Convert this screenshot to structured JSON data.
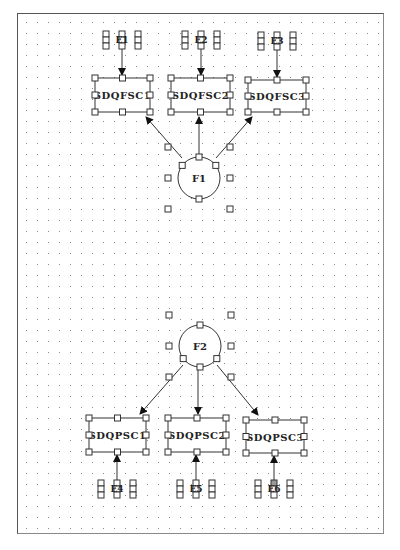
{
  "diagram": {
    "background": "#ffffff",
    "grid_spacing": 11,
    "factors": [
      {
        "id": "F1",
        "label": "F1",
        "cx": 199,
        "cy": 178,
        "r": 21
      },
      {
        "id": "F2",
        "label": "F2",
        "cx": 200,
        "cy": 346,
        "r": 21
      }
    ],
    "indicators": [
      {
        "id": "top1",
        "label": "SDQFSC1",
        "x": 95,
        "y": 78,
        "w": 55,
        "h": 34,
        "factor": "F1"
      },
      {
        "id": "top2",
        "label": "SDQFSC2",
        "x": 171,
        "y": 78,
        "w": 59,
        "h": 34,
        "factor": "F1"
      },
      {
        "id": "top3",
        "label": "SDQFSC3",
        "x": 248,
        "y": 80,
        "w": 58,
        "h": 32,
        "factor": "F1"
      },
      {
        "id": "bot1",
        "label": "SDQPSC1",
        "x": 89,
        "y": 418,
        "w": 57,
        "h": 34,
        "factor": "F2"
      },
      {
        "id": "bot2",
        "label": "SDQPSC2",
        "x": 168,
        "y": 418,
        "w": 58,
        "h": 34,
        "factor": "F2"
      },
      {
        "id": "bot3",
        "label": "SDQPSC3",
        "x": 246,
        "y": 420,
        "w": 58,
        "h": 33,
        "factor": "F2"
      }
    ],
    "errors": [
      {
        "id": "E1",
        "label": "E1",
        "cx": 122,
        "cy": 40,
        "target": "top1"
      },
      {
        "id": "E2",
        "label": "E2",
        "cx": 201,
        "cy": 40,
        "target": "top2"
      },
      {
        "id": "E3",
        "label": "E3",
        "cx": 277,
        "cy": 41,
        "target": "top3"
      },
      {
        "id": "E4",
        "label": "E4",
        "cx": 117,
        "cy": 489,
        "target": "bot1"
      },
      {
        "id": "E5",
        "label": "E5",
        "cx": 196,
        "cy": 489,
        "target": "bot2"
      },
      {
        "id": "E6",
        "label": "E6",
        "cx": 274,
        "cy": 489,
        "target": "bot3",
        "selected": true
      }
    ],
    "paths": [
      {
        "from": "F1",
        "to": "top1",
        "x1": 182,
        "y1": 158,
        "x2": 146,
        "y2": 117
      },
      {
        "from": "F1",
        "to": "top2",
        "x1": 199,
        "y1": 157,
        "x2": 199,
        "y2": 117
      },
      {
        "from": "F1",
        "to": "top3",
        "x1": 216,
        "y1": 158,
        "x2": 252,
        "y2": 117
      },
      {
        "from": "F2",
        "to": "bot1",
        "x1": 183,
        "y1": 365,
        "x2": 140,
        "y2": 414
      },
      {
        "from": "F2",
        "to": "bot2",
        "x1": 198,
        "y1": 369,
        "x2": 198,
        "y2": 414
      },
      {
        "from": "F2",
        "to": "bot3",
        "x1": 217,
        "y1": 365,
        "x2": 258,
        "y2": 415
      }
    ]
  }
}
